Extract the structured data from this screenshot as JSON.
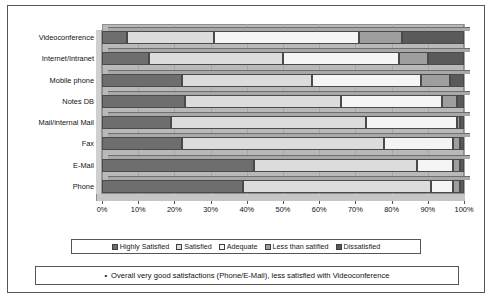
{
  "chart_data": {
    "type": "bar",
    "orientation": "horizontal",
    "stacked": true,
    "normalized_percent": true,
    "title": "",
    "xlabel": "",
    "ylabel": "",
    "xlim": [
      0,
      100
    ],
    "grid": true,
    "legend_position": "bottom",
    "categories": [
      "Videoconference",
      "Internet/Intranet",
      "Mobile phone",
      "Notes DB",
      "Mail/internal Mail",
      "Fax",
      "E-Mail",
      "Phone"
    ],
    "tick_labels": [
      "0%",
      "10%",
      "20%",
      "30%",
      "40%",
      "50%",
      "60%",
      "70%",
      "80%",
      "90%",
      "100%"
    ],
    "tick_values": [
      0,
      10,
      20,
      30,
      40,
      50,
      60,
      70,
      80,
      90,
      100
    ],
    "series": [
      {
        "name": "Highly Satisfied",
        "color": "#6e6e6e",
        "values": [
          7,
          13,
          22,
          23,
          19,
          22,
          42,
          39
        ]
      },
      {
        "name": "Satisfied",
        "color": "#dcdcdc",
        "values": [
          24,
          37,
          36,
          43,
          54,
          56,
          45,
          52
        ]
      },
      {
        "name": "Adequate",
        "color": "#f5f5f5",
        "values": [
          40,
          32,
          30,
          28,
          25,
          19,
          10,
          6
        ]
      },
      {
        "name": "Less than satified",
        "color": "#9e9e9e",
        "values": [
          12,
          8,
          8,
          4,
          1,
          2,
          2,
          2
        ]
      },
      {
        "name": "Dissatisfied",
        "color": "#5a5a5a",
        "values": [
          17,
          10,
          4,
          2,
          1,
          1,
          1,
          1
        ]
      }
    ]
  },
  "caption": {
    "bullet": "•",
    "text": "Overall very good satisfactions (Phone/E-Mail), less satisfied with Videoconference"
  }
}
